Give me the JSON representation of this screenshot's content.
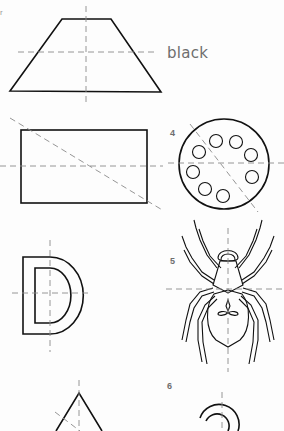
{
  "worksheet": {
    "corner_mark": "r",
    "color_label": "black",
    "figures": [
      {
        "number": "",
        "shape": "trapezoid",
        "mirror_lines": [
          "vertical",
          "horizontal"
        ]
      },
      {
        "number": "",
        "shape": "rectangle",
        "mirror_lines": [
          "horizontal",
          "diagonal"
        ]
      },
      {
        "number": "4",
        "shape": "circle-with-8-small-circles",
        "mirror_lines": [
          "horizontal",
          "diagonal"
        ]
      },
      {
        "number": "",
        "shape": "letter-D",
        "mirror_lines": [
          "vertical",
          "horizontal"
        ]
      },
      {
        "number": "5",
        "shape": "spider",
        "mirror_lines": [
          "vertical",
          "horizontal"
        ]
      },
      {
        "number": "",
        "shape": "triangle",
        "mirror_lines": [
          "vertical",
          "diagonal"
        ]
      },
      {
        "number": "6",
        "shape": "arc-hook",
        "mirror_lines": [
          "vertical"
        ]
      }
    ]
  },
  "colors": {
    "outline": "#111111",
    "mirror_line": "#8a8a8a",
    "label_text": "#6e6e6e"
  }
}
